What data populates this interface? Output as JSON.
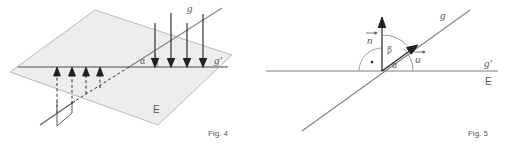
{
  "sheet": {
    "background_color": "#ffffff",
    "ink_color": "#58595b",
    "plane_fill_color": "#ededed",
    "plane_edge_color": "#a7a9ac"
  },
  "figures": [
    {
      "id": "fig-4",
      "caption": "Fig. 4",
      "description": "Line g inclined to plane E with its orthogonal projection g' in the plane; angle alpha between g and g'.",
      "labels": {
        "line_g": "g",
        "line_g_prime": "g′",
        "plane_E": "E",
        "angle_alpha": "α"
      },
      "projection_arrow_count_down": 4,
      "projection_arrow_count_up": 4
    },
    {
      "id": "fig-5",
      "caption": "Fig. 5",
      "description": "Cross-section view: normal vector n perpendicular to plane trace E, direction vector u along line g, angle alpha between g and g', angle beta between n and u.",
      "labels": {
        "vector_n": "n",
        "vector_u": "u",
        "line_g": "g",
        "line_g_prime": "g′",
        "plane_E": "E",
        "angle_alpha": "α",
        "angle_beta": "β",
        "right_angle_marker": "·"
      }
    }
  ]
}
